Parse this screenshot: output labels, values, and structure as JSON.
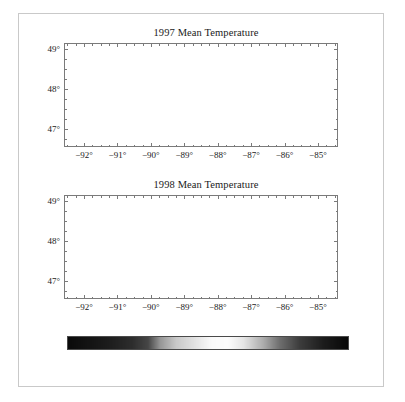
{
  "figure": {
    "panels": [
      {
        "id": "1997",
        "title": "1997 Mean Temperature",
        "x_ticks": [
          "−92°",
          "−91°",
          "−90°",
          "−89°",
          "−88°",
          "−87°",
          "−86°",
          "−85°"
        ],
        "y_ticks": [
          "49°",
          "48°",
          "47°"
        ]
      },
      {
        "id": "1998",
        "title": "1998 Mean Temperature",
        "x_ticks": [
          "−92°",
          "−91°",
          "−90°",
          "−89°",
          "−88°",
          "−87°",
          "−86°",
          "−85°"
        ],
        "y_ticks": [
          "49°",
          "48°",
          "47°"
        ]
      }
    ],
    "colorbar": {
      "labels": [
        "4",
        "5",
        "6",
        "7",
        "8",
        "9",
        "10",
        "11°C"
      ],
      "values": [
        4,
        5,
        6,
        7,
        8,
        9,
        10,
        11
      ],
      "min": 4,
      "max": 11,
      "unit": "°C"
    }
  },
  "chart_data": {
    "type": "heatmap",
    "xlabel": "Longitude",
    "ylabel": "Latitude",
    "xlim": [
      -92.6,
      -84.4
    ],
    "ylim": [
      46.55,
      49.15
    ],
    "xticks": [
      -92,
      -91,
      -90,
      -89,
      -88,
      -87,
      -86,
      -85
    ],
    "xticklabels": [
      "−92°",
      "−91°",
      "−90°",
      "−89°",
      "−88°",
      "−87°",
      "−86°",
      "−85°"
    ],
    "yticks": [
      49,
      48,
      47
    ],
    "yticklabels": [
      "49°",
      "48°",
      "47°"
    ],
    "xminor_step": 0.25,
    "yminor_step": 0.25,
    "grid": false,
    "legend": "none",
    "colorbar": {
      "orientation": "horizontal",
      "min": 4,
      "max": 11,
      "ticks": [
        4,
        5,
        6,
        7,
        8,
        9,
        10,
        11
      ],
      "ticklabels": [
        "4",
        "5",
        "6",
        "7",
        "8",
        "9",
        "10",
        "11°C"
      ],
      "unit": "°C",
      "colormap": "cyclic-grayscale",
      "colormap_stops": [
        {
          "value": 4.0,
          "gray": 10
        },
        {
          "value": 5.0,
          "gray": 28
        },
        {
          "value": 5.6,
          "gray": 45
        },
        {
          "value": 6.0,
          "gray": 70
        },
        {
          "value": 6.3,
          "gray": 150
        },
        {
          "value": 6.7,
          "gray": 200
        },
        {
          "value": 7.2,
          "gray": 228
        },
        {
          "value": 7.6,
          "gray": 250
        },
        {
          "value": 8.0,
          "gray": 252
        },
        {
          "value": 8.4,
          "gray": 228
        },
        {
          "value": 8.9,
          "gray": 170
        },
        {
          "value": 9.3,
          "gray": 110
        },
        {
          "value": 9.8,
          "gray": 60
        },
        {
          "value": 10.4,
          "gray": 28
        },
        {
          "value": 11.0,
          "gray": 8
        }
      ]
    },
    "panels": [
      {
        "name": "1997 Mean Temperature",
        "year": 1997,
        "summary": "Cool year. Western arm near 6 °C (light gray); large cold core over the eastern-central basin near 4–5 °C rendered very dark.",
        "field_range_degC": [
          4.0,
          6.8
        ],
        "regions": [
          {
            "label": "western arm (Duluth)",
            "lon": -91.9,
            "lat": 46.85,
            "value_degC": 6.2
          },
          {
            "label": "Apostle Islands",
            "lon": -90.7,
            "lat": 46.95,
            "value_degC": 6.3
          },
          {
            "label": "north-central shore",
            "lon": -90.2,
            "lat": 48.0,
            "value_degC": 6.0
          },
          {
            "label": "Isle Royale",
            "lon": -88.9,
            "lat": 48.0,
            "value_degC": 5.4
          },
          {
            "label": "Thunder Bay",
            "lon": -89.0,
            "lat": 48.5,
            "value_degC": 5.8
          },
          {
            "label": "central basin core",
            "lon": -87.6,
            "lat": 48.1,
            "value_degC": 4.3
          },
          {
            "label": "eastern basin core",
            "lon": -87.0,
            "lat": 47.6,
            "value_degC": 4.2
          },
          {
            "label": "Keweenaw south",
            "lon": -87.3,
            "lat": 47.0,
            "value_degC": 4.6
          },
          {
            "label": "Whitefish Bay",
            "lon": -85.0,
            "lat": 46.8,
            "value_degC": 6.4
          },
          {
            "label": "eastern shelf",
            "lon": -85.4,
            "lat": 47.3,
            "value_degC": 6.3
          }
        ]
      },
      {
        "name": "1998 Mean Temperature",
        "year": 1998,
        "summary": "Warm year. Open-lake interior near 8 °C (white); nearshore and eastern margins run 9.5–11 °C and render dark again on the cyclic scale.",
        "field_range_degC": [
          7.4,
          11.0
        ],
        "regions": [
          {
            "label": "western arm (Duluth)",
            "lon": -92.0,
            "lat": 46.75,
            "value_degC": 10.4
          },
          {
            "label": "Apostle Islands",
            "lon": -90.8,
            "lat": 46.85,
            "value_degC": 10.2
          },
          {
            "label": "north-central open lake",
            "lon": -89.5,
            "lat": 48.2,
            "value_degC": 7.8
          },
          {
            "label": "Isle Royale",
            "lon": -88.9,
            "lat": 48.05,
            "value_degC": 7.7
          },
          {
            "label": "Thunder Bay",
            "lon": -89.1,
            "lat": 48.75,
            "value_degC": 10.8
          },
          {
            "label": "central basin",
            "lon": -87.8,
            "lat": 47.9,
            "value_degC": 7.7
          },
          {
            "label": "eastern basin",
            "lon": -86.8,
            "lat": 47.5,
            "value_degC": 8.1
          },
          {
            "label": "Keweenaw south",
            "lon": -87.5,
            "lat": 46.9,
            "value_degC": 9.7
          },
          {
            "label": "Whitefish Bay",
            "lon": -85.0,
            "lat": 46.8,
            "value_degC": 10.9
          },
          {
            "label": "eastern shelf",
            "lon": -85.2,
            "lat": 47.4,
            "value_degC": 10.6
          }
        ]
      }
    ]
  }
}
